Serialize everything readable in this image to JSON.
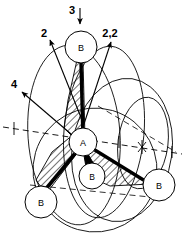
{
  "figure": {
    "type": "molecular-symmetry-diagram",
    "background_color": "#ffffff",
    "line_color": "#000000",
    "bond_color": "#000000",
    "hatch_color": "#000000",
    "dashed_color": "#000000"
  },
  "axis_labels": [
    {
      "name": "axis-label-3",
      "text": "3",
      "x": 72,
      "y": 12,
      "arrow": "down"
    },
    {
      "name": "axis-label-2",
      "text": "2",
      "x": 44,
      "y": 34,
      "arrow": "up-left"
    },
    {
      "name": "axis-label-2-2",
      "text": "2,2",
      "x": 105,
      "y": 34,
      "arrow": "up-right"
    },
    {
      "name": "axis-label-4",
      "text": "4",
      "x": 13,
      "y": 84,
      "arrow": "up-left"
    }
  ],
  "atoms": [
    {
      "name": "atom-A",
      "label": "A",
      "cx": 83,
      "cy": 142,
      "r": 14
    },
    {
      "name": "atom-B-top",
      "label": "B",
      "cx": 81,
      "cy": 47,
      "r": 16
    },
    {
      "name": "atom-B-front",
      "label": "B",
      "cx": 92,
      "cy": 176,
      "r": 13
    },
    {
      "name": "atom-B-left",
      "label": "B",
      "cx": 41,
      "cy": 202,
      "r": 16
    },
    {
      "name": "atom-B-right",
      "label": "B",
      "cx": 159,
      "cy": 185,
      "r": 16
    }
  ],
  "bonds": [
    {
      "name": "bond-A-B-top",
      "from": "atom-A",
      "to": "atom-B-top",
      "style": "thick-wedge"
    },
    {
      "name": "bond-A-B-front",
      "from": "atom-A",
      "to": "atom-B-front",
      "style": "thick-wedge"
    },
    {
      "name": "bond-A-B-left",
      "from": "atom-A",
      "to": "atom-B-left",
      "style": "thick-wedge"
    },
    {
      "name": "bond-A-B-right",
      "from": "atom-A",
      "to": "atom-B-right",
      "style": "thick-wedge"
    }
  ],
  "hatched_planes": [
    {
      "name": "mirror-plane-upper",
      "orientation": "vertical-band"
    },
    {
      "name": "mirror-plane-lower-left",
      "orientation": "down-left-triangle"
    },
    {
      "name": "mirror-plane-lower-right",
      "orientation": "down-right-triangle"
    }
  ],
  "symmetry_ellipses": [
    {
      "name": "ellipse-outer-left"
    },
    {
      "name": "ellipse-outer-right"
    },
    {
      "name": "ellipse-middle"
    },
    {
      "name": "ellipse-right-small"
    },
    {
      "name": "ellipse-bottom"
    }
  ],
  "dashed_axis": {
    "name": "dashed-horizontal-axis",
    "tick_marks": [
      "tick-left",
      "tick-center",
      "tick-star",
      "tick-right"
    ],
    "star_marker": "×"
  }
}
